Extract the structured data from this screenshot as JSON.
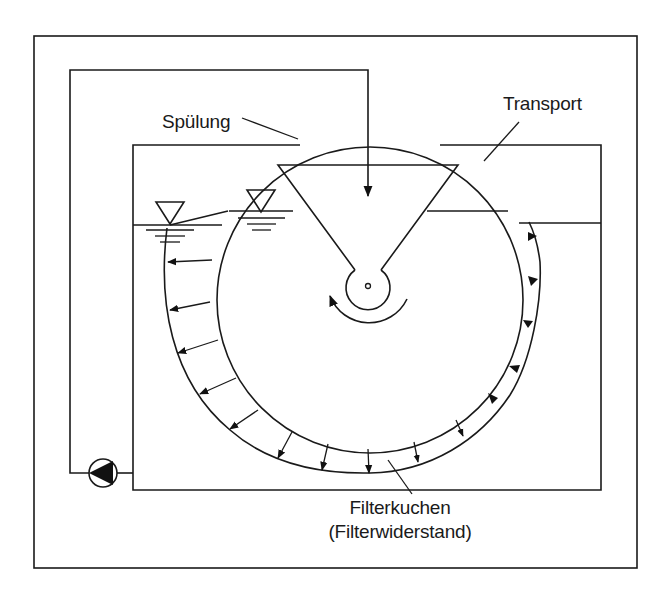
{
  "diagram": {
    "labels": {
      "rinse": "Spülung",
      "transport": "Transport",
      "filter_cake": "Filterkuchen",
      "filter_resistance": "(Filterwiderstand)"
    },
    "components": [
      {
        "id": "outer-frame",
        "type": "frame"
      },
      {
        "id": "rinse-pipe",
        "type": "pipe-loop"
      },
      {
        "id": "pump",
        "type": "pump-symbol"
      },
      {
        "id": "tank",
        "type": "trough"
      },
      {
        "id": "drum",
        "type": "rotary-drum-filter"
      },
      {
        "id": "funnel",
        "type": "collection-funnel"
      },
      {
        "id": "hub",
        "type": "drum-shaft"
      },
      {
        "id": "rotation-arrow",
        "type": "curved-arrow",
        "direction": "clockwise"
      },
      {
        "id": "water-level-outer",
        "type": "water-level-symbol"
      },
      {
        "id": "water-level-inner",
        "type": "water-level-symbol"
      },
      {
        "id": "filter-cake",
        "type": "cake-layer"
      }
    ],
    "colors": {
      "line": "#1a1a1a",
      "background": "#ffffff"
    }
  }
}
